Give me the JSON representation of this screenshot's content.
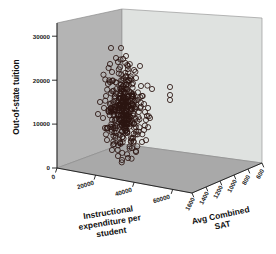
{
  "chart_data": {
    "type": "scatter",
    "title": "",
    "subtitle": "",
    "projection": "3d",
    "grid": false,
    "legend": null,
    "axes": {
      "y": {
        "label": "Out-of-state tuition",
        "ticks": [
          0,
          10000,
          20000,
          30000
        ],
        "tick_labels": [
          "0",
          "10000",
          "20000",
          "30000"
        ],
        "range": [
          0,
          32000
        ],
        "orientation": "vertical-left"
      },
      "x": {
        "label": "Instructional expenditure per student",
        "label_lines": [
          "Instructional",
          "expenditure per",
          "student"
        ],
        "ticks": [
          0,
          20000,
          40000,
          60000
        ],
        "tick_labels": [
          "0",
          "20000",
          "40000",
          "60000"
        ],
        "range": [
          0,
          70000
        ],
        "orientation": "depth-front-left"
      },
      "z": {
        "label": "Avg Combined SAT",
        "label_lines": [
          "Avg Combined",
          "SAT"
        ],
        "ticks": [
          1600,
          1400,
          1200,
          1000,
          800,
          600
        ],
        "tick_labels": [
          "1600",
          "1400",
          "1200",
          "1000",
          "800",
          "600"
        ],
        "range": [
          1600,
          600
        ],
        "orientation": "depth-front-right"
      }
    },
    "marker_style": {
      "shape": "open-circle",
      "edge_color": "#2b1410",
      "fill": "none",
      "size_px": 2.6
    },
    "point_count": 330,
    "notable_outliers": [
      {
        "tuition": 26200,
        "note": "upper isolated pair"
      },
      {
        "tuition": 26100,
        "note": "upper isolated pair"
      },
      {
        "tuition": 17800,
        "note": "right isolated"
      },
      {
        "tuition": 16200,
        "note": "right isolated"
      },
      {
        "tuition": 14900,
        "note": "right isolated"
      }
    ],
    "colors": {
      "wall_left": "#b4b4b4",
      "wall_back": "#dfe2e0",
      "floor": "#a9a9a9",
      "marker_edge": "#2b1410",
      "axis": "#1a1a1a",
      "background": "#ffffff"
    }
  }
}
